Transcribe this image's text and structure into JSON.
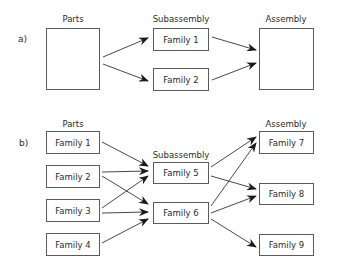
{
  "diagram": {
    "panel_a": {
      "tag": "a)",
      "columns": {
        "parts": "Parts",
        "subassembly": "Subassembly",
        "assembly": "Assembly"
      },
      "subassembly_boxes": [
        "Family 1",
        "Family 2"
      ],
      "edges": [
        [
          "Parts",
          "Family 1"
        ],
        [
          "Parts",
          "Family 2"
        ],
        [
          "Family 1",
          "Assembly"
        ],
        [
          "Family 2",
          "Assembly"
        ]
      ]
    },
    "panel_b": {
      "tag": "b)",
      "columns": {
        "parts": "Parts",
        "subassembly": "Subassembly",
        "assembly": "Assembly"
      },
      "parts_boxes": [
        "Family 1",
        "Family 2",
        "Family 3",
        "Family 4"
      ],
      "subassembly_boxes": [
        "Family 5",
        "Family 6"
      ],
      "assembly_boxes": [
        "Family 7",
        "Family 8",
        "Family 9"
      ],
      "edges": [
        [
          "Family 1",
          "Family 5"
        ],
        [
          "Family 2",
          "Family 5"
        ],
        [
          "Family 2",
          "Family 6"
        ],
        [
          "Family 3",
          "Family 5"
        ],
        [
          "Family 3",
          "Family 6"
        ],
        [
          "Family 4",
          "Family 6"
        ],
        [
          "Family 5",
          "Family 7"
        ],
        [
          "Family 5",
          "Family 8"
        ],
        [
          "Family 6",
          "Family 7"
        ],
        [
          "Family 6",
          "Family 8"
        ],
        [
          "Family 6",
          "Family 9"
        ]
      ]
    },
    "colors": {
      "stroke": "#5a5a5a",
      "arrow": "#1a1a1a",
      "text": "#2b2b2b"
    }
  }
}
